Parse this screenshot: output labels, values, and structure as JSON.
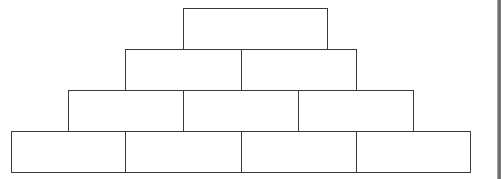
{
  "diagram": {
    "type": "number-pyramid",
    "line_color": "#3a3a3a",
    "rows": [
      {
        "row": 1,
        "bricks": [
          {
            "x": 183,
            "y": 8,
            "w": 145,
            "h": 42,
            "value": ""
          }
        ]
      },
      {
        "row": 2,
        "bricks": [
          {
            "x": 125,
            "y": 49,
            "w": 117,
            "h": 42,
            "value": ""
          },
          {
            "x": 241,
            "y": 49,
            "w": 116,
            "h": 42,
            "value": ""
          }
        ]
      },
      {
        "row": 3,
        "bricks": [
          {
            "x": 68,
            "y": 90,
            "w": 116,
            "h": 42,
            "value": ""
          },
          {
            "x": 183,
            "y": 90,
            "w": 116,
            "h": 42,
            "value": ""
          },
          {
            "x": 298,
            "y": 90,
            "w": 116,
            "h": 42,
            "value": ""
          }
        ]
      },
      {
        "row": 4,
        "bricks": [
          {
            "x": 11,
            "y": 131,
            "w": 115,
            "h": 42,
            "value": ""
          },
          {
            "x": 125,
            "y": 131,
            "w": 117,
            "h": 42,
            "value": ""
          },
          {
            "x": 241,
            "y": 131,
            "w": 116,
            "h": 42,
            "value": ""
          },
          {
            "x": 356,
            "y": 131,
            "w": 115,
            "h": 42,
            "value": ""
          }
        ]
      }
    ]
  }
}
